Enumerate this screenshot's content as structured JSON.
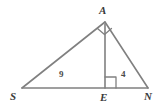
{
  "figure": {
    "kind": "geometry-diagram",
    "width": 161,
    "height": 107,
    "background_color": "#ffffff",
    "stroke_color": "#808080",
    "label_color": "#3a3a3a",
    "measure_label_color": "#4a4a4a"
  },
  "vertices": [
    {
      "id": "A",
      "label": "A",
      "x": 105,
      "y": 22
    },
    {
      "id": "S",
      "label": "S",
      "x": 22,
      "y": 88
    },
    {
      "id": "E",
      "label": "E",
      "x": 105,
      "y": 88
    },
    {
      "id": "N",
      "label": "N",
      "x": 148,
      "y": 88
    }
  ],
  "segments": [
    {
      "id": "SA",
      "from": "S",
      "to": "A"
    },
    {
      "id": "AN",
      "from": "A",
      "to": "N"
    },
    {
      "id": "SN",
      "from": "S",
      "to": "N"
    },
    {
      "id": "AE",
      "from": "A",
      "to": "E"
    }
  ],
  "measures": [
    {
      "id": "SE",
      "segment": "S-E",
      "value": "9"
    },
    {
      "id": "EN",
      "segment": "E-N",
      "value": "4"
    }
  ],
  "right_angles": [
    {
      "id": "angle-A",
      "at": "A",
      "between": "SA and AN"
    },
    {
      "id": "angle-E",
      "at": "E",
      "between": "AE and EN"
    }
  ]
}
